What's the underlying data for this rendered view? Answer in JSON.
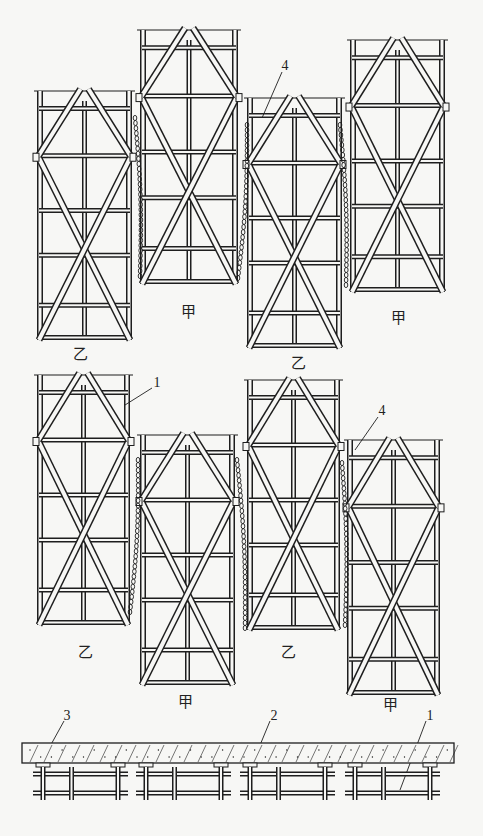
{
  "diagram": {
    "type": "construction-scaffold-diagram",
    "frame_labels": {
      "jia": "甲",
      "yi": "乙"
    },
    "frames": [
      {
        "id": "f1",
        "row": 1,
        "label": "乙",
        "x": 37,
        "y": 91,
        "w": 95,
        "h": 249,
        "label_pos": [
          80,
          354
        ]
      },
      {
        "id": "f2",
        "row": 1,
        "label": "甲",
        "x": 140,
        "y": 30,
        "w": 98,
        "h": 254,
        "label_pos": [
          188,
          312
        ]
      },
      {
        "id": "f3",
        "row": 1,
        "label": "乙",
        "x": 247,
        "y": 98,
        "w": 95,
        "h": 250,
        "label_pos": [
          298,
          363
        ]
      },
      {
        "id": "f4",
        "row": 1,
        "label": "甲",
        "x": 350,
        "y": 40,
        "w": 95,
        "h": 252,
        "label_pos": [
          398,
          318
        ]
      },
      {
        "id": "f5",
        "row": 2,
        "label": "乙",
        "x": 37,
        "y": 375,
        "w": 93,
        "h": 250,
        "label_pos": [
          85,
          652
        ]
      },
      {
        "id": "f6",
        "row": 2,
        "label": "甲",
        "x": 140,
        "y": 435,
        "w": 95,
        "h": 250,
        "label_pos": [
          185,
          702
        ]
      },
      {
        "id": "f7",
        "row": 2,
        "label": "乙",
        "x": 247,
        "y": 380,
        "w": 93,
        "h": 250,
        "label_pos": [
          288,
          652
        ]
      },
      {
        "id": "f8",
        "row": 2,
        "label": "甲",
        "x": 347,
        "y": 440,
        "w": 93,
        "h": 255,
        "label_pos": [
          390,
          705
        ]
      }
    ],
    "callouts": [
      {
        "text": "4",
        "pos": [
          285,
          66
        ]
      },
      {
        "text": "1",
        "pos": [
          157,
          383
        ]
      },
      {
        "text": "4",
        "pos": [
          382,
          411
        ]
      },
      {
        "text": "3",
        "pos": [
          67,
          716
        ]
      },
      {
        "text": "2",
        "pos": [
          274,
          716
        ]
      },
      {
        "text": "1",
        "pos": [
          430,
          716
        ]
      }
    ],
    "legend_numbers": [
      "1",
      "2",
      "3",
      "4"
    ]
  }
}
